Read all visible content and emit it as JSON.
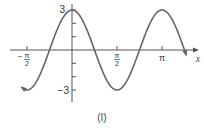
{
  "chart_data": {
    "type": "line",
    "function": "y = 3cos(2x)",
    "title": "",
    "caption": "(I)",
    "xlabel": "x",
    "ylabel": "",
    "x_tick_labels": [
      "-π/2",
      "π/2",
      "π"
    ],
    "x_ticks": [
      -1.5708,
      1.5708,
      3.1416
    ],
    "y_tick_labels": [
      "3",
      "-3"
    ],
    "y_ticks": [
      -3,
      -2,
      -1,
      1,
      2,
      3
    ],
    "xlim": [
      -1.85,
      4.0
    ],
    "ylim": [
      -3.5,
      3.5
    ],
    "grid": false,
    "series": [
      {
        "name": "3cos(2x)",
        "x": [
          -1.76,
          -1.5708,
          -1.1781,
          -0.7854,
          -0.3927,
          0,
          0.3927,
          0.7854,
          1.1781,
          1.5708,
          1.9635,
          2.3562,
          2.7489,
          3.1416,
          3.5343,
          3.927,
          3.99
        ],
        "values": [
          -2.8,
          -3,
          -2.12,
          0,
          2.12,
          3,
          2.12,
          0,
          -2.12,
          -3,
          -2.12,
          0,
          2.12,
          3,
          2.12,
          0,
          -0.19
        ]
      }
    ],
    "zeros": [
      -0.7854,
      0.7854,
      2.3562,
      3.927
    ],
    "arrows_at_ends": true
  },
  "labels": {
    "y_top": "3",
    "y_bottom": "−3",
    "x_axis": "x",
    "x_neg_half_pi_num": "π",
    "x_neg_half_pi_den": "2",
    "x_neg_sign": "−",
    "x_half_pi_num": "π",
    "x_half_pi_den": "2",
    "x_pi": "π",
    "caption": "(I)"
  }
}
